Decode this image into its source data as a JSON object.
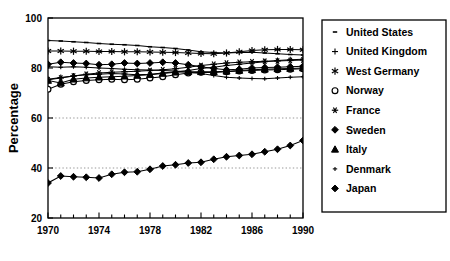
{
  "chart_data": {
    "type": "line",
    "title": "",
    "xlabel": "",
    "ylabel": "Percentage",
    "xlim": [
      1970,
      1990
    ],
    "ylim": [
      20,
      100
    ],
    "yticks": [
      20,
      40,
      60,
      80,
      100
    ],
    "ytick_labels": [
      "20",
      "40",
      "60",
      "80",
      "100"
    ],
    "xticks": [
      1970,
      1974,
      1978,
      1982,
      1986,
      1990
    ],
    "xtick_labels": [
      "1970",
      "1974",
      "1978",
      "1982",
      "1986",
      "1990"
    ],
    "xticks_minor": [
      1971,
      1972,
      1973,
      1975,
      1976,
      1977,
      1979,
      1980,
      1981,
      1983,
      1984,
      1985,
      1987,
      1988,
      1989
    ],
    "grid": "horizontal-dotted-at-40-and-60",
    "gridlines": [
      40,
      60
    ],
    "legend_position": "right-outside",
    "x": [
      1970,
      1971,
      1972,
      1973,
      1974,
      1975,
      1976,
      1977,
      1978,
      1979,
      1980,
      1981,
      1982,
      1983,
      1984,
      1985,
      1986,
      1987,
      1988,
      1989,
      1990
    ],
    "series": [
      {
        "name": "United States",
        "marker": "dash",
        "values": [
          91.0,
          90.8,
          90.5,
          90.2,
          89.8,
          89.5,
          89.3,
          89.0,
          88.5,
          88.2,
          87.8,
          87.2,
          86.5,
          86.2,
          86.0,
          86.2,
          86.3,
          86.0,
          85.7,
          85.4,
          85.2
        ]
      },
      {
        "name": "United Kingdom",
        "marker": "plus",
        "values": [
          75.5,
          76.2,
          76.8,
          77.3,
          77.5,
          77.8,
          77.6,
          77.3,
          77.5,
          78.0,
          78.5,
          79.0,
          79.8,
          80.3,
          81.0,
          81.5,
          82.0,
          82.5,
          83.0,
          83.3,
          83.5
        ]
      },
      {
        "name": "West Germany",
        "marker": "star6",
        "values": [
          86.8,
          86.8,
          86.7,
          86.7,
          86.6,
          86.6,
          86.5,
          86.5,
          86.4,
          86.3,
          86.2,
          86.0,
          85.8,
          85.7,
          86.0,
          86.5,
          87.0,
          87.3,
          87.4,
          87.4,
          87.3
        ]
      },
      {
        "name": "Norway",
        "marker": "circle-open",
        "values": [
          71.5,
          73.5,
          74.5,
          75.0,
          75.3,
          75.5,
          75.3,
          75.5,
          76.0,
          76.5,
          77.3,
          78.0,
          78.3,
          78.2,
          78.5,
          78.8,
          79.0,
          79.2,
          79.3,
          79.5,
          79.7
        ]
      },
      {
        "name": "France",
        "marker": "asterisk",
        "values": [
          75.3,
          76.0,
          76.8,
          77.5,
          78.0,
          78.3,
          78.5,
          78.7,
          79.0,
          79.3,
          79.7,
          80.3,
          81.0,
          81.5,
          82.0,
          82.3,
          82.5,
          82.7,
          82.8,
          83.0,
          83.2
        ]
      },
      {
        "name": "Sweden",
        "marker": "diamond-filled",
        "values": [
          81.5,
          82.3,
          82.0,
          81.8,
          81.3,
          81.5,
          82.0,
          81.8,
          82.0,
          82.3,
          82.0,
          81.3,
          80.5,
          79.8,
          79.3,
          79.5,
          80.0,
          80.2,
          80.3,
          80.5,
          80.7
        ]
      },
      {
        "name": "Italy",
        "marker": "triangle-filled",
        "values": [
          75.0,
          74.0,
          75.5,
          76.0,
          76.3,
          76.5,
          76.7,
          77.0,
          77.3,
          77.8,
          78.3,
          78.5,
          78.5,
          78.5,
          78.7,
          79.0,
          79.3,
          79.5,
          79.7,
          79.8,
          80.0
        ]
      },
      {
        "name": "Denmark",
        "marker": "small-plus",
        "values": [
          80.5,
          80.3,
          80.5,
          80.3,
          80.0,
          79.8,
          79.5,
          79.3,
          79.2,
          79.0,
          78.8,
          78.3,
          77.8,
          77.0,
          76.3,
          76.0,
          75.8,
          75.7,
          76.0,
          76.3,
          76.5
        ]
      },
      {
        "name": "Japan",
        "marker": "diamond-filled",
        "values": [
          34.0,
          36.8,
          36.5,
          36.3,
          36.0,
          37.5,
          38.3,
          38.5,
          39.5,
          40.8,
          41.3,
          42.0,
          42.3,
          43.5,
          44.5,
          45.0,
          45.5,
          46.5,
          47.5,
          49.0,
          51.0
        ]
      }
    ]
  },
  "caption": {
    "text": ""
  }
}
